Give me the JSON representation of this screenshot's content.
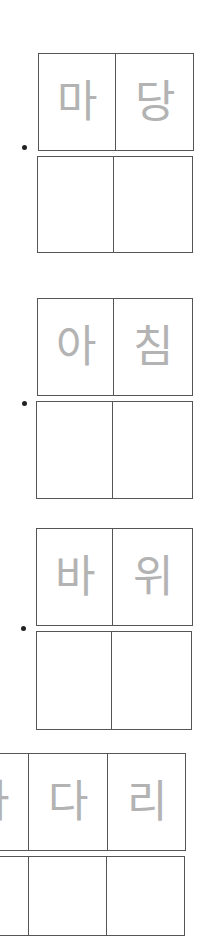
{
  "worksheet": {
    "groups": [
      {
        "trace": [
          "마",
          "당"
        ],
        "blank_cells": 2
      },
      {
        "trace": [
          "아",
          "침"
        ],
        "blank_cells": 2
      },
      {
        "trace": [
          "바",
          "위"
        ],
        "blank_cells": 2
      },
      {
        "trace": [
          "사",
          "다",
          "리"
        ],
        "blank_cells": 3
      }
    ],
    "colors": {
      "border": "#555555",
      "trace_text": "#b3b3b3",
      "bullet": "#222222"
    }
  }
}
